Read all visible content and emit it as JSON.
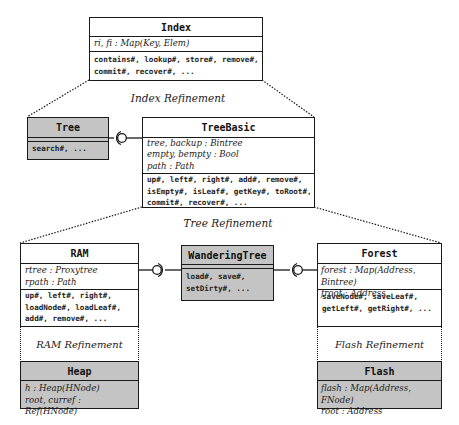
{
  "index": {
    "title": "Index",
    "attrs": [
      "ri, fi : Map(Key, Elem)"
    ],
    "ops": [
      "contains#, lookup#, store#, remove#,",
      "commit#, recover#, ..."
    ]
  },
  "labels": {
    "index_refinement": "Index Refinement",
    "tree_refinement": "Tree Refinement"
  },
  "tree": {
    "title": "Tree",
    "ops": [
      "search#, ..."
    ]
  },
  "tree_basic": {
    "title": "TreeBasic",
    "attrs": [
      "tree, backup : Bintree",
      "empty, bempty : Bool",
      "path : Path"
    ],
    "ops": [
      "up#, left#, right#, add#, remove#,",
      "isEmpty#, isLeaf#, getKey#, toRoot#,",
      "commit#, recover#, ..."
    ]
  },
  "ram": {
    "title": "RAM",
    "attrs": [
      "rtree : Proxytree",
      "rpath : Path"
    ],
    "ops": [
      "up#, left#, right#,",
      "loadNode#, loadLeaf#,",
      "add#, remove#, ..."
    ],
    "refinement": "RAM Refinement"
  },
  "heap": {
    "title": "Heap",
    "attrs": [
      "h : Heap(HNode)",
      "root, curref : Ref(HNode)"
    ]
  },
  "wandering_tree": {
    "title": "WanderingTree",
    "ops": [
      "load#, save#,",
      "setDirty#, ..."
    ]
  },
  "forest": {
    "title": "Forest",
    "attrs": [
      "forest : Map(Address, Bintree)",
      "froot : Address"
    ],
    "ops": [
      "saveNode#, saveLeaf#,",
      "getLeft#, getRight#, ..."
    ],
    "refinement": "Flash Refinement"
  },
  "flash": {
    "title": "Flash",
    "attrs": [
      "flash : Map(Address, FNode)",
      "root : Address"
    ]
  },
  "colors": {
    "gray_fill": "#c4c4c4",
    "line": "#1a1a1a"
  }
}
